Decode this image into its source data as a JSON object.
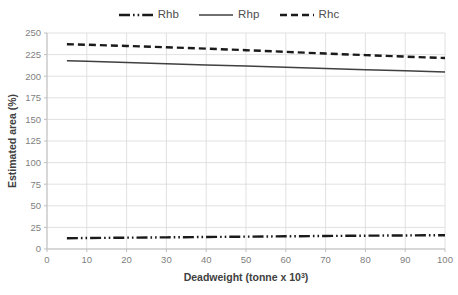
{
  "chart_data": {
    "type": "line",
    "title": "",
    "xlabel": "Deadweight (tonne x 10³)",
    "ylabel": "Estimated area (%)",
    "xlim": [
      0,
      100
    ],
    "ylim": [
      0,
      250
    ],
    "xticks": [
      0,
      10,
      20,
      30,
      40,
      50,
      60,
      70,
      80,
      90,
      100
    ],
    "yticks": [
      0,
      25,
      50,
      75,
      100,
      125,
      150,
      175,
      200,
      225,
      250
    ],
    "grid": true,
    "legend_position": "top-center",
    "x": [
      5,
      10,
      20,
      30,
      40,
      50,
      60,
      70,
      80,
      90,
      100
    ],
    "series": [
      {
        "name": "Rhb",
        "style": "dash-dot-dot",
        "color": "#1a1a1a",
        "values": [
          12.5,
          12.7,
          13.1,
          13.5,
          13.9,
          14.3,
          14.7,
          15.1,
          15.4,
          15.7,
          16.0
        ]
      },
      {
        "name": "Rhp",
        "style": "solid",
        "color": "#404040",
        "values": [
          218.0,
          217.3,
          215.9,
          214.5,
          213.1,
          211.7,
          210.3,
          208.9,
          207.6,
          206.3,
          205.0
        ]
      },
      {
        "name": "Rhc",
        "style": "dashed",
        "color": "#1a1a1a",
        "values": [
          237.0,
          236.4,
          235.0,
          233.5,
          231.9,
          230.1,
          228.2,
          226.2,
          224.4,
          222.7,
          221.0
        ]
      }
    ]
  },
  "legend": {
    "items": [
      {
        "label": "Rhb"
      },
      {
        "label": "Rhp"
      },
      {
        "label": "Rhc"
      }
    ]
  },
  "axes": {
    "x_title": "Deadweight (tonne x 10",
    "x_title_sup": "3",
    "x_title_tail": ")",
    "y_title": "Estimated area (%)",
    "x_tick_labels": [
      "0",
      "10",
      "20",
      "30",
      "40",
      "50",
      "60",
      "70",
      "80",
      "90",
      "100"
    ],
    "y_tick_labels": [
      "0",
      "25",
      "50",
      "75",
      "100",
      "125",
      "150",
      "175",
      "200",
      "225",
      "250"
    ]
  },
  "colors": {
    "grid": "#d9d9d9",
    "axis": "#bfbfbf",
    "tick_text": "#7f7f7f",
    "title_text": "#404040",
    "series_dark": "#1a1a1a",
    "series_gray": "#404040",
    "background": "#ffffff"
  }
}
